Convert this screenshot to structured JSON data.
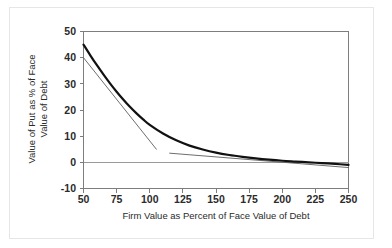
{
  "chart_data": {
    "type": "line",
    "title": "",
    "xlabel": "Firm Value as Percent of Face Value of Debt",
    "ylabel": "Value of Put as % of Face Value of Debt",
    "ylabel_line1": "Value of Put as % of Face",
    "ylabel_line2": "Value of Debt",
    "xlim": [
      50,
      250
    ],
    "ylim": [
      -10,
      50
    ],
    "xticks": [
      50,
      75,
      100,
      125,
      150,
      175,
      200,
      225,
      250
    ],
    "yticks": [
      50,
      40,
      30,
      20,
      10,
      0,
      -10
    ],
    "xtick_labels": [
      "50",
      "75",
      "100",
      "125",
      "150",
      "175",
      "200",
      "225",
      "250"
    ],
    "ytick_labels": [
      "50",
      "40",
      "30",
      "20",
      "10",
      "0",
      "-10"
    ],
    "grid": false,
    "legend": "none",
    "zero_line": 0,
    "curve_color": "#111111",
    "tangent_color": "#5d5d5d",
    "frame_color": "#7d7d7d",
    "series": [
      {
        "name": "Value of Put",
        "style": "solid-thick",
        "color": "#111111",
        "x": [
          50,
          55,
          60,
          65,
          70,
          75,
          80,
          85,
          90,
          95,
          100,
          110,
          120,
          130,
          140,
          150,
          160,
          170,
          180,
          190,
          200,
          210,
          220,
          230,
          240,
          250
        ],
        "y": [
          45.0,
          41.0,
          37.2,
          33.6,
          30.2,
          27.0,
          24.0,
          21.2,
          18.7,
          16.4,
          14.3,
          11.0,
          8.4,
          6.4,
          4.9,
          3.7,
          2.8,
          2.1,
          1.5,
          1.0,
          0.6,
          0.3,
          0.0,
          -0.3,
          -0.6,
          -1.0
        ]
      },
      {
        "name": "Tangent at low firm value",
        "style": "solid-thin",
        "color": "#5d5d5d",
        "x": [
          50,
          105
        ],
        "y": [
          40.0,
          5.0
        ]
      },
      {
        "name": "Tangent at high firm value",
        "style": "solid-thin",
        "color": "#5d5d5d",
        "x": [
          115,
          250
        ],
        "y": [
          3.5,
          -2.0
        ]
      }
    ]
  },
  "figure": {
    "background": "#ffffff",
    "border_color": "#e6e6e6"
  }
}
